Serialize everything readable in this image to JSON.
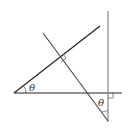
{
  "diagram": {
    "type": "geometry",
    "labels": {
      "angle_left": "θ",
      "angle_right": "θ"
    },
    "colors": {
      "line": "#222222",
      "vertical_line": "#888888",
      "background": "#ffffff"
    },
    "elements": {
      "horizontal_line": {
        "x1": 14,
        "y1": 93,
        "x2": 122,
        "y2": 93
      },
      "rising_line": {
        "x1": 14,
        "y1": 93,
        "x2": 100,
        "y2": 26
      },
      "vertical_line": {
        "x1": 108,
        "y1": 11,
        "x2": 108,
        "y2": 122
      },
      "crossing_line": {
        "x1": 43,
        "y1": 33,
        "x2": 108,
        "y2": 121
      }
    },
    "right_angle_markers": 2
  }
}
